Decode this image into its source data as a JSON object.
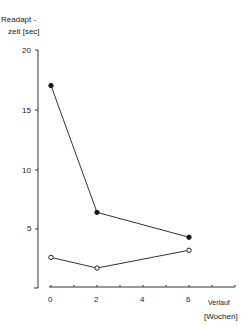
{
  "chart_data": {
    "type": "line",
    "title": "",
    "ylabel_line1": "Readapt -",
    "ylabel_line2": "zeit [sec]",
    "xlabel_line1": "Verlauf",
    "xlabel_line2": "[Wochen]",
    "x": [
      0,
      2,
      6
    ],
    "xticks": [
      "0",
      "2",
      "4",
      "6"
    ],
    "yticks": [
      "5",
      "10",
      "15",
      "20"
    ],
    "ylim": [
      0,
      20
    ],
    "xlim": [
      0,
      8
    ],
    "grid": false,
    "series": [
      {
        "name": "filled",
        "marker": "filled-circle",
        "values": [
          17,
          6.3,
          4.2
        ]
      },
      {
        "name": "open",
        "marker": "open-circle",
        "values": [
          2.5,
          1.6,
          3.1
        ]
      }
    ]
  }
}
